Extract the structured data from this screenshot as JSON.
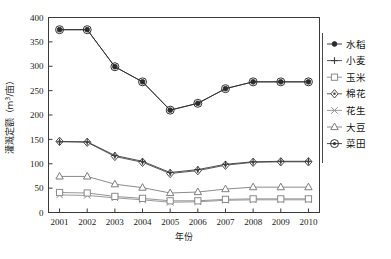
{
  "chart_data": {
    "type": "line",
    "title": "",
    "xlabel": "年份",
    "ylabel": "灌溉定额（m³/亩）",
    "ylabel_main": "灌溉定额（m",
    "ylabel_sup": "3",
    "ylabel_tail": "/亩）",
    "categories": [
      "2001",
      "2002",
      "2003",
      "2004",
      "2005",
      "2006",
      "2007",
      "2008",
      "2009",
      "2010"
    ],
    "x": [
      2001,
      2002,
      2003,
      2004,
      2005,
      2006,
      2007,
      2008,
      2009,
      2010
    ],
    "xlim": [
      2000.6,
      2010.4
    ],
    "ylim": [
      0,
      400
    ],
    "yticks": [
      0,
      50,
      100,
      150,
      200,
      250,
      300,
      350,
      400
    ],
    "ytick_labels": [
      "0",
      "50",
      "100",
      "150",
      "200",
      "250",
      "300",
      "350",
      "400"
    ],
    "grid": false,
    "legend_position": "right",
    "series": [
      {
        "name": "水稻",
        "marker": "filled-circle",
        "color": "#2b2b2b",
        "values": [
          375,
          375,
          299,
          268,
          210,
          224,
          254,
          268,
          268,
          268
        ]
      },
      {
        "name": "小麦",
        "marker": "plus",
        "color": "#3c3c3c",
        "values": [
          145,
          145,
          117,
          105,
          82,
          88,
          99,
          104,
          105,
          105
        ]
      },
      {
        "name": "玉米",
        "marker": "open-square",
        "color": "#8a8a8a",
        "values": [
          41,
          40,
          33,
          29,
          24,
          24,
          27,
          28,
          28,
          28
        ]
      },
      {
        "name": "棉花",
        "marker": "diamond-dot",
        "color": "#4a4a4a",
        "values": [
          146,
          144,
          115,
          103,
          80,
          86,
          97,
          103,
          104,
          104
        ]
      },
      {
        "name": "花生",
        "marker": "cross-x",
        "color": "#8f8f8f",
        "values": [
          36,
          35,
          30,
          26,
          21,
          22,
          25,
          26,
          26,
          26
        ]
      },
      {
        "name": "大豆",
        "marker": "open-triangle",
        "color": "#7d7d7d",
        "values": [
          74,
          74,
          58,
          51,
          40,
          42,
          48,
          52,
          52,
          52
        ]
      },
      {
        "name": "菜田",
        "marker": "circle-dot",
        "color": "#333333",
        "values": [
          375,
          375,
          299,
          268,
          210,
          224,
          254,
          268,
          268,
          268
        ]
      }
    ]
  },
  "legend": {
    "items": [
      {
        "label": "水稻",
        "marker": "filled-circle"
      },
      {
        "label": "小麦",
        "marker": "plus"
      },
      {
        "label": "玉米",
        "marker": "open-square"
      },
      {
        "label": "棉花",
        "marker": "diamond-dot"
      },
      {
        "label": "花生",
        "marker": "cross-x"
      },
      {
        "label": "大豆",
        "marker": "open-triangle"
      },
      {
        "label": "菜田",
        "marker": "circle-dot"
      }
    ]
  },
  "colors": {
    "axis": "#3a3a3a",
    "text": "#1a1a1a",
    "background": "#ffffff"
  }
}
